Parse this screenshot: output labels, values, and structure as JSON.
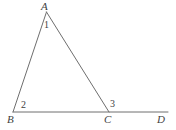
{
  "figure": {
    "background_color": "#ffffff",
    "stroke_color": "#6e6e6e",
    "label_color": "#3f3f3f",
    "stroke_width": 1,
    "width": 176,
    "height": 130
  },
  "vertices": {
    "A": {
      "label": "A",
      "x": 46.5,
      "y": 12
    },
    "B": {
      "label": "B",
      "x": 13,
      "y": 112
    },
    "C": {
      "label": "C",
      "x": 109,
      "y": 112
    },
    "D": {
      "label": "D",
      "x": 168,
      "y": 112
    }
  },
  "vertex_labels": [
    {
      "name": "label-A",
      "text": "A",
      "x": 41,
      "y": 1
    },
    {
      "name": "label-B",
      "text": "B",
      "x": 7,
      "y": 114
    },
    {
      "name": "label-C",
      "text": "C",
      "x": 104,
      "y": 114
    },
    {
      "name": "label-D",
      "text": "D",
      "x": 157,
      "y": 114
    }
  ],
  "angle_labels": [
    {
      "name": "angle-1",
      "text": "1",
      "x": 44,
      "y": 20
    },
    {
      "name": "angle-2",
      "text": "2",
      "x": 21,
      "y": 100
    },
    {
      "name": "angle-3",
      "text": "3",
      "x": 110,
      "y": 99
    }
  ],
  "segments": [
    {
      "name": "segment-AB",
      "from": "A",
      "to": "B",
      "x1": 46.5,
      "y1": 12,
      "x2": 13,
      "y2": 112
    },
    {
      "name": "segment-AC",
      "from": "A",
      "to": "C",
      "x1": 46.5,
      "y1": 12,
      "x2": 109,
      "y2": 112
    },
    {
      "name": "segment-BD",
      "from": "B",
      "to": "D",
      "x1": 13,
      "y1": 112,
      "x2": 168,
      "y2": 112
    }
  ]
}
